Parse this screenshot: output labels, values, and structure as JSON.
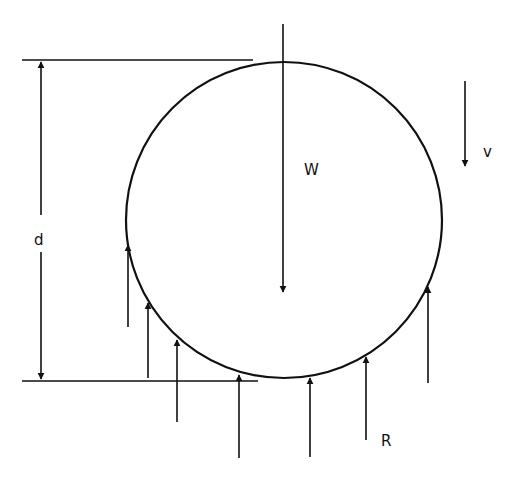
{
  "diagram": {
    "labels": {
      "diameter": "d",
      "weight": "W",
      "velocity": "v",
      "reaction": "R"
    },
    "colors": {
      "stroke": "#111111",
      "background": "#ffffff"
    },
    "circle": {
      "cx": 284,
      "cy": 220,
      "r": 158
    },
    "dimension": {
      "x": 41,
      "top_y": 60,
      "bottom_y": 381,
      "top_line": [
        22,
        253
      ],
      "bottom_line": [
        22,
        258
      ]
    },
    "weight_arrow": {
      "x": 283,
      "y1": 24,
      "y2": 292
    },
    "velocity_arrow": {
      "x": 465,
      "y1": 81,
      "y2": 166
    },
    "reaction_arrows": [
      {
        "x": 128,
        "y_tail": 327,
        "y_tip": 245
      },
      {
        "x": 148,
        "y_tail": 378,
        "y_tip": 303
      },
      {
        "x": 177,
        "y_tail": 422,
        "y_tip": 340
      },
      {
        "x": 239,
        "y_tail": 458,
        "y_tip": 375
      },
      {
        "x": 310,
        "y_tail": 457,
        "y_tip": 378
      },
      {
        "x": 366,
        "y_tail": 440,
        "y_tip": 357
      },
      {
        "x": 428,
        "y_tail": 383,
        "y_tip": 287
      }
    ]
  }
}
